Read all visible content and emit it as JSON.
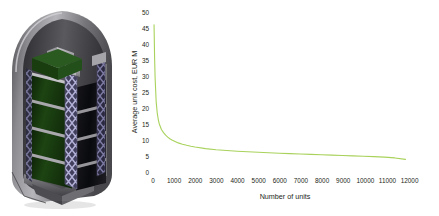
{
  "figure": {
    "background_color": "#ffffff",
    "illustration": {
      "name": "satellite-stack-in-fairing",
      "description": "CAD render of a stack of satellites with dark green solar panels held by lattice truss columns inside a rocket payload fairing",
      "colors": {
        "fairing_outer": "#6f6f72",
        "fairing_inner_shadow": "#3a3a3e",
        "fairing_highlight": "#b9b9bd",
        "solar_panel": "#16380f",
        "solar_panel_dark": "#0d2208",
        "satellite_body": "#101014",
        "truss_lattice": "#8d8bb5",
        "truss_lattice_dark": "#45435f",
        "structure_gray": "#9a9a9e",
        "baseplate": "#55555a"
      }
    }
  },
  "chart_data": {
    "type": "line",
    "title": "",
    "subtitle": "",
    "xlabel": "Number of units",
    "ylabel": "Average unit cost, EUR M",
    "xlim": [
      0,
      12500
    ],
    "ylim": [
      0,
      50
    ],
    "grid": false,
    "legend": null,
    "legend_position": "none",
    "axis_lines_visible": false,
    "series": [
      {
        "name": "Average unit cost",
        "color": "#a9d25c",
        "line_width": 1.1,
        "x": [
          50,
          75,
          100,
          150,
          200,
          250,
          300,
          400,
          500,
          600,
          700,
          800,
          900,
          1000,
          1200,
          1400,
          1600,
          1800,
          2000,
          2500,
          3000,
          3500,
          4000,
          4500,
          5000,
          5500,
          6000,
          6500,
          7000,
          7500,
          8000,
          8500,
          9000,
          9500,
          10000,
          10500,
          11000,
          11500,
          12000
        ],
        "y": [
          46.0,
          36.0,
          29.5,
          22.0,
          18.5,
          16.4,
          15.0,
          13.3,
          12.3,
          11.5,
          10.9,
          10.4,
          10.0,
          9.7,
          9.1,
          8.7,
          8.35,
          8.05,
          7.8,
          7.3,
          6.95,
          6.7,
          6.5,
          6.32,
          6.15,
          6.0,
          5.87,
          5.75,
          5.63,
          5.52,
          5.4,
          5.28,
          5.16,
          5.04,
          4.92,
          4.79,
          4.65,
          4.4,
          3.95
        ]
      }
    ],
    "y_ticks": [
      {
        "value": 0,
        "label": "0"
      },
      {
        "value": 5,
        "label": "5"
      },
      {
        "value": 10,
        "label": "10"
      },
      {
        "value": 15,
        "label": "15"
      },
      {
        "value": 20,
        "label": "20"
      },
      {
        "value": 25,
        "label": "25"
      },
      {
        "value": 30,
        "label": "30"
      },
      {
        "value": 35,
        "label": "35"
      },
      {
        "value": 40,
        "label": "40"
      },
      {
        "value": 45,
        "label": "45"
      },
      {
        "value": 50,
        "label": "50"
      }
    ],
    "x_ticks": [
      {
        "value": 0,
        "label": "0"
      },
      {
        "value": 1000,
        "label": "1000"
      },
      {
        "value": 2000,
        "label": "2000"
      },
      {
        "value": 3000,
        "label": "3000"
      },
      {
        "value": 4000,
        "label": "4000"
      },
      {
        "value": 5000,
        "label": "5000"
      },
      {
        "value": 6000,
        "label": "6000"
      },
      {
        "value": 7000,
        "label": "7000"
      },
      {
        "value": 8000,
        "label": "8000"
      },
      {
        "value": 9000,
        "label": "9000"
      },
      {
        "value": 10000,
        "label": "10000"
      },
      {
        "value": 11000,
        "label": "11000"
      },
      {
        "value": 12000,
        "label": "12000"
      }
    ]
  }
}
